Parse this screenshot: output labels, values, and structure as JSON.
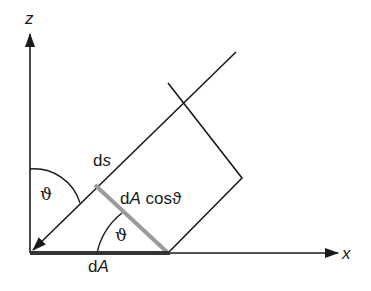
{
  "diagram": {
    "axes": {
      "z_label": "z",
      "x_label": "x"
    },
    "labels": {
      "ds": "ds",
      "ds_d": "d",
      "ds_s": "s",
      "theta_top": "ϑ",
      "theta_bottom": "ϑ",
      "dA_cos_d": "d",
      "dA_cos_A": "A",
      "dA_cos_rest": " cosϑ",
      "dA_d": "d",
      "dA_A": "A"
    },
    "colors": {
      "line": "#1a1a1a",
      "projection": "#9a9a9a",
      "base": "#333333"
    }
  }
}
